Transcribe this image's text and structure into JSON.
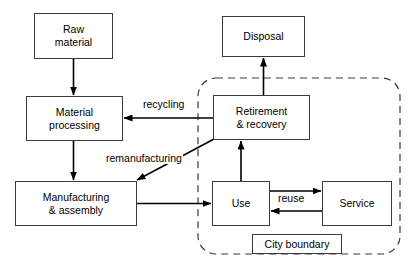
{
  "diagram": {
    "background_color": "#ffffff",
    "stroke_color": "#3a3a3a",
    "arrow_color": "#000000",
    "nodes": [
      {
        "id": "raw-material",
        "label": "Raw\nmaterial",
        "x": 34,
        "y": 13,
        "w": 79,
        "h": 46
      },
      {
        "id": "material-processing",
        "label": "Material\nprocessing",
        "x": 26,
        "y": 96,
        "w": 97,
        "h": 45
      },
      {
        "id": "manufacturing",
        "label": "Manufacturing\n& assembly",
        "x": 15,
        "y": 181,
        "w": 122,
        "h": 45
      },
      {
        "id": "disposal",
        "label": "Disposal",
        "x": 222,
        "y": 16,
        "w": 83,
        "h": 41
      },
      {
        "id": "retirement",
        "label": "Retirement\n& recovery",
        "x": 213,
        "y": 95,
        "w": 97,
        "h": 45
      },
      {
        "id": "use",
        "label": "Use",
        "x": 212,
        "y": 181,
        "w": 58,
        "h": 45
      },
      {
        "id": "service",
        "label": "Service",
        "x": 322,
        "y": 181,
        "w": 70,
        "h": 45
      }
    ],
    "edge_labels": [
      {
        "id": "recycling",
        "text": "recycling",
        "x": 142,
        "y": 98
      },
      {
        "id": "remanufacturing",
        "text": "remanufacturing",
        "x": 105,
        "y": 152
      },
      {
        "id": "reuse",
        "text": "reuse",
        "x": 277,
        "y": 192
      }
    ],
    "boundary": {
      "id": "city-boundary",
      "label": "City boundary",
      "x": 198,
      "y": 78,
      "w": 202,
      "h": 176,
      "radius": 18,
      "dash": "7,5",
      "label_box": {
        "x": 252,
        "y": 234,
        "w": 90,
        "h": 20
      }
    },
    "edges": [
      {
        "id": "raw-to-material",
        "from": "raw-material",
        "to": "material-processing"
      },
      {
        "id": "material-to-manufacturing",
        "from": "material-processing",
        "to": "manufacturing"
      },
      {
        "id": "manufacturing-to-use",
        "from": "manufacturing",
        "to": "use"
      },
      {
        "id": "use-to-retirement",
        "from": "use",
        "to": "retirement"
      },
      {
        "id": "retirement-to-disposal",
        "from": "retirement",
        "to": "disposal"
      },
      {
        "id": "recycling-edge",
        "from": "retirement",
        "to": "material-processing",
        "label": "recycling"
      },
      {
        "id": "remanufacturing-edge",
        "from": "retirement",
        "to": "manufacturing",
        "label": "remanufacturing"
      },
      {
        "id": "use-to-service",
        "from": "use",
        "to": "service",
        "label": "reuse"
      },
      {
        "id": "service-to-use",
        "from": "service",
        "to": "use",
        "label": "reuse"
      }
    ]
  }
}
